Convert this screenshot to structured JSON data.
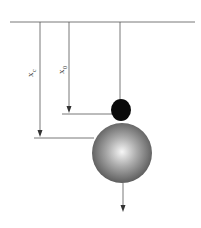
{
  "diagram": {
    "labels": {
      "xc": {
        "main": "x",
        "sub": "c"
      },
      "x0": {
        "main": "x",
        "sub": "0"
      }
    },
    "colors": {
      "line": "#555555",
      "small_ball": "#0a0a0a",
      "big_ball_center": "#f4f4f4",
      "big_ball_edge": "#5a5a5a"
    }
  }
}
